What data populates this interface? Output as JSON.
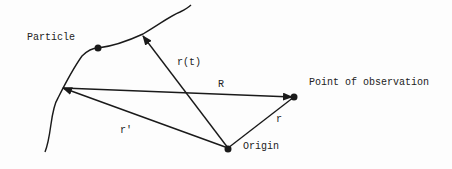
{
  "labels": {
    "particle": "Particle",
    "point_of_observation": "Point of observation",
    "origin": "Origin",
    "r_t": "r(t)",
    "R": "R",
    "r_prime": "r'",
    "r": "r"
  },
  "colors": {
    "ink": "#1a1a1a",
    "background": "#fdfdfd"
  }
}
